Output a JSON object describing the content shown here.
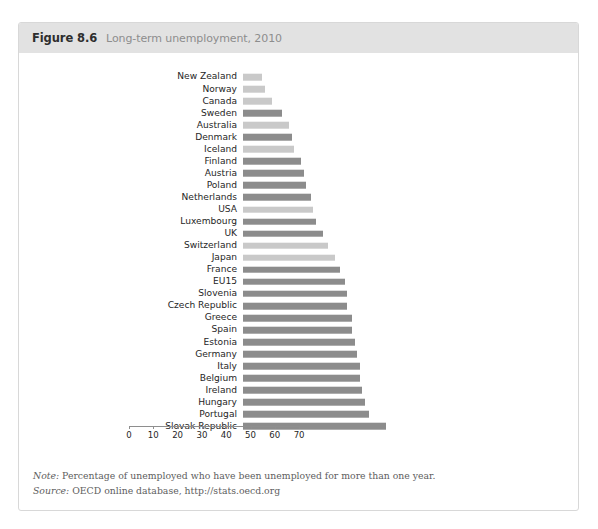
{
  "figure": {
    "number": "Figure 8.6",
    "title": "Long-term unemployment, 2010"
  },
  "footer": {
    "note_lead": "Note:",
    "note_text": " Percentage of unemployed who have been unemployed for more than one year.",
    "source_lead": "Source:",
    "source_text": " OECD online database, http://stats.oecd.org"
  },
  "colors": {
    "bar_dark": "#8c8c8c",
    "bar_light": "#c9c9c9",
    "header_band": "#e2e2e2",
    "axis": "#8e8e8e",
    "card_border": "#d8d8d8"
  },
  "chart_data": {
    "type": "bar",
    "orientation": "horizontal",
    "title": "Long-term unemployment, 2010",
    "xlabel": "",
    "ylabel": "",
    "xlim": [
      0,
      70
    ],
    "xticks": [
      0,
      10,
      20,
      30,
      40,
      50,
      60,
      70
    ],
    "grid": false,
    "legend": false,
    "note": "Percentage of unemployed who have been unemployed for more than one year.",
    "source": "OECD online database, http://stats.oecd.org",
    "categories": [
      "New Zealand",
      "Norway",
      "Canada",
      "Sweden",
      "Australia",
      "Denmark",
      "Iceland",
      "Finland",
      "Austria",
      "Poland",
      "Netherlands",
      "USA",
      "Luxembourg",
      "UK",
      "Switzerland",
      "Japan",
      "France",
      "EU15",
      "Slovenia",
      "Czech Republic",
      "Greece",
      "Spain",
      "Estonia",
      "Germany",
      "Italy",
      "Belgium",
      "Ireland",
      "Hungary",
      "Portugal",
      "Slovak Republic"
    ],
    "values": [
      8,
      9,
      12,
      16,
      19,
      20,
      21,
      24,
      25,
      26,
      28,
      29,
      30,
      33,
      35,
      38,
      40,
      42,
      43,
      43,
      45,
      45,
      46,
      47,
      48,
      48,
      49,
      50,
      52,
      59
    ],
    "bar_shades": [
      "light",
      "light",
      "light",
      "dark",
      "light",
      "dark",
      "light",
      "dark",
      "dark",
      "dark",
      "dark",
      "light",
      "dark",
      "dark",
      "light",
      "light",
      "dark",
      "dark",
      "dark",
      "dark",
      "dark",
      "dark",
      "dark",
      "dark",
      "dark",
      "dark",
      "dark",
      "dark",
      "dark",
      "dark"
    ]
  }
}
